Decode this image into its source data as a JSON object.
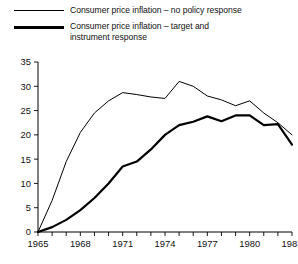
{
  "legend": {
    "position": "top-left",
    "entries": [
      {
        "label": "Consumer price inflation – no policy response",
        "style": "thin",
        "series": "no_policy_response"
      },
      {
        "label": "Consumer price inflation – target and\ninstrument response",
        "style": "thick",
        "series": "target_and_instrument_response"
      }
    ]
  },
  "chart_data": {
    "type": "line",
    "title": "",
    "subtitle": "",
    "xlabel": "",
    "ylabel": "",
    "xlim": [
      1965,
      1983
    ],
    "ylim": [
      0,
      35
    ],
    "yticks": [
      0,
      5,
      10,
      15,
      20,
      25,
      30,
      35
    ],
    "xticks": [
      1965,
      1966,
      1967,
      1968,
      1969,
      1970,
      1971,
      1972,
      1973,
      1974,
      1975,
      1976,
      1977,
      1978,
      1979,
      1980,
      1981,
      1982,
      1983
    ],
    "xticklabels": [
      "1965",
      "",
      "",
      "1968",
      "",
      "",
      "1971",
      "",
      "",
      "1974",
      "",
      "",
      "1977",
      "",
      "",
      "1980",
      "",
      "",
      "1983"
    ],
    "grid": false,
    "x": [
      1965,
      1966,
      1967,
      1968,
      1969,
      1970,
      1971,
      1972,
      1973,
      1974,
      1975,
      1976,
      1977,
      1978,
      1979,
      1980,
      1981,
      1982,
      1983
    ],
    "series": [
      {
        "name": "Consumer price inflation – no policy response",
        "style": "thin",
        "color": "#000000",
        "values": [
          0,
          6.5,
          14.5,
          20.5,
          24.5,
          27.0,
          28.7,
          28.3,
          27.8,
          27.5,
          31.0,
          30.0,
          28.0,
          27.2,
          26.0,
          27.0,
          24.5,
          22.5,
          20.0
        ]
      },
      {
        "name": "Consumer price inflation – target and instrument response",
        "style": "thick",
        "color": "#000000",
        "values": [
          0,
          1.0,
          2.5,
          4.5,
          7.0,
          10.0,
          13.5,
          14.5,
          17.0,
          20.0,
          22.0,
          22.7,
          23.8,
          22.8,
          24.0,
          24.0,
          22.0,
          22.2,
          18.0
        ]
      }
    ]
  },
  "axis_labels": {
    "y": [
      "0",
      "5",
      "10",
      "15",
      "20",
      "25",
      "30",
      "35"
    ],
    "x": [
      "1965",
      "1968",
      "1971",
      "1974",
      "1977",
      "1980",
      "1983"
    ]
  }
}
